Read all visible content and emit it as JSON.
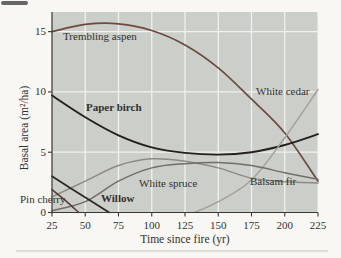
{
  "figure": {
    "type_note": "scanned textbook line chart of forest succession after fire"
  },
  "chart_data": {
    "type": "line",
    "title": "",
    "xlabel": "Time since fire (yr)",
    "ylabel": "Basal area (m²/ha)",
    "xlim": [
      25,
      225
    ],
    "ylim": [
      0,
      16.6
    ],
    "xticks": [
      25,
      50,
      75,
      100,
      125,
      150,
      175,
      200,
      225
    ],
    "yticks": [
      0,
      5,
      10,
      15
    ],
    "grid": true,
    "legend_position": "inline-labels",
    "plot_bg": "#cbcec9",
    "grid_color": "#f1f2ee",
    "axis_color": "#3a3733",
    "series": [
      {
        "id": "trembling-aspen",
        "name": "Trembling aspen",
        "color": "#6d4a41",
        "width": 1.7,
        "points": [
          [
            25,
            15.0
          ],
          [
            50,
            15.6
          ],
          [
            75,
            15.65
          ],
          [
            100,
            15.1
          ],
          [
            125,
            13.9
          ],
          [
            150,
            12.0
          ],
          [
            175,
            9.4
          ],
          [
            200,
            6.6
          ],
          [
            225,
            2.6
          ]
        ]
      },
      {
        "id": "paper-birch",
        "name": "Paper birch",
        "color": "#23201d",
        "width": 1.9,
        "points": [
          [
            25,
            9.7
          ],
          [
            50,
            7.9
          ],
          [
            75,
            6.4
          ],
          [
            100,
            5.4
          ],
          [
            125,
            4.95
          ],
          [
            150,
            4.8
          ],
          [
            175,
            5.0
          ],
          [
            200,
            5.6
          ],
          [
            225,
            6.5
          ]
        ]
      },
      {
        "id": "white-cedar",
        "name": "White cedar",
        "color": "#a3a099",
        "width": 1.5,
        "points": [
          [
            132,
            0
          ],
          [
            150,
            0.9
          ],
          [
            175,
            2.7
          ],
          [
            200,
            6.2
          ],
          [
            225,
            10.2
          ]
        ]
      },
      {
        "id": "white-spruce",
        "name": "White spruce",
        "color": "#8d8b85",
        "width": 1.5,
        "points": [
          [
            25,
            1.3
          ],
          [
            50,
            2.6
          ],
          [
            75,
            3.9
          ],
          [
            100,
            4.45
          ],
          [
            125,
            4.25
          ],
          [
            150,
            3.7
          ],
          [
            175,
            2.85
          ],
          [
            200,
            2.55
          ],
          [
            225,
            2.45
          ]
        ]
      },
      {
        "id": "balsam-fir",
        "name": "Balsam fir",
        "color": "#6f6e68",
        "width": 1.5,
        "points": [
          [
            25,
            0.15
          ],
          [
            50,
            0.9
          ],
          [
            75,
            2.6
          ],
          [
            100,
            3.7
          ],
          [
            125,
            4.05
          ],
          [
            150,
            4.15
          ],
          [
            175,
            3.9
          ],
          [
            200,
            3.3
          ],
          [
            225,
            2.75
          ]
        ]
      },
      {
        "id": "pin-cherry",
        "name": "Pin cherry",
        "color": "#533a32",
        "width": 1.5,
        "points": [
          [
            25,
            1.9
          ],
          [
            35,
            1.0
          ],
          [
            45,
            0
          ]
        ]
      },
      {
        "id": "willow",
        "name": "Willow",
        "color": "#2b2724",
        "width": 1.7,
        "points": [
          [
            25,
            3.0
          ],
          [
            45,
            1.6
          ],
          [
            68,
            0
          ]
        ]
      }
    ],
    "labels": [
      {
        "id": "trembling-aspen",
        "text": "Trembling aspen",
        "x": 63,
        "y": 40,
        "color": "#897b6f",
        "bold": false
      },
      {
        "id": "paper-birch",
        "text": "Paper birch",
        "x": 86,
        "y": 111,
        "color": "#26221f",
        "bold": true
      },
      {
        "id": "white-cedar",
        "text": "White cedar",
        "x": 256,
        "y": 95,
        "color": "#a09c95",
        "bold": false
      },
      {
        "id": "white-spruce",
        "text": "White spruce",
        "x": 139,
        "y": 187,
        "color": "#8e8c86",
        "bold": false
      },
      {
        "id": "balsam-fir",
        "text": "Balsam fir",
        "x": 250,
        "y": 185,
        "color": "#3b3833",
        "bold": false
      },
      {
        "id": "pin-cherry",
        "text": "Pin cherry",
        "x": 20,
        "y": 203,
        "color": "#46423d",
        "bold": false
      },
      {
        "id": "willow",
        "text": "Willow",
        "x": 101,
        "y": 202,
        "color": "#2b2724",
        "bold": true
      }
    ]
  }
}
